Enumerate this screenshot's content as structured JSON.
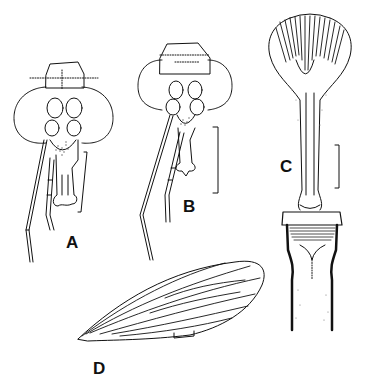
{
  "figure": {
    "panels": [
      {
        "id": "A",
        "label": "A",
        "subject": "head, frontal view with antenna and scale bar"
      },
      {
        "id": "B",
        "label": "B",
        "subject": "head, frontal view with antenna and scale bar"
      },
      {
        "id": "C",
        "label": "C",
        "subject": "elongate mouthpart/proboscis structure with stippled base and scale bar"
      },
      {
        "id": "D",
        "label": "D",
        "subject": "wing with longitudinal veins and scale bar"
      }
    ],
    "colors": {
      "ink": "#111111",
      "background": "#ffffff",
      "stipple": "#555555"
    }
  }
}
